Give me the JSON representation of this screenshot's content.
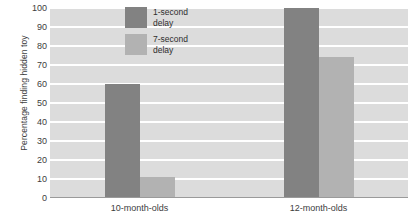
{
  "chart_data": {
    "type": "bar",
    "title": "",
    "xlabel": "",
    "ylabel": "Percentage finding hidden toy",
    "categories": [
      "10-month-olds",
      "12-month-olds"
    ],
    "series": [
      {
        "name": "1-second delay",
        "values": [
          60,
          100
        ],
        "color": "#828282"
      },
      {
        "name": "7-second delay",
        "values": [
          11,
          74
        ],
        "color": "#b2b2b2"
      }
    ],
    "ylim": [
      0,
      100
    ],
    "ytick_values": [
      0,
      10,
      20,
      30,
      40,
      50,
      60,
      70,
      80,
      90,
      100
    ],
    "ytick_labels": [
      "0",
      "10",
      "20",
      "30",
      "40",
      "50",
      "60",
      "70",
      "80",
      "90",
      "100"
    ],
    "grid": true,
    "grid_color": "#ffffff",
    "plot_background": "#dcdcdc",
    "legend_position": "upper-center",
    "legend_entries": [
      "1-second\ndelay",
      "7-second\ndelay"
    ]
  }
}
